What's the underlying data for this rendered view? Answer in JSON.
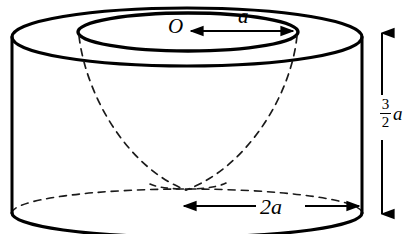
{
  "figure": {
    "stroke_color": "#000000",
    "background_color": "#ffffff",
    "dashed_color": "#1a1a1a",
    "labels": {
      "center": "O",
      "radius": "a",
      "diameter": "2a",
      "height_numerator": "3",
      "height_denominator": "2",
      "height_unit": "a"
    },
    "dimensions": {
      "top_outer_ellipse": {
        "cx": 187,
        "cy": 37,
        "rx": 175,
        "ry": 29
      },
      "top_inner_ellipse": {
        "cx": 188,
        "cy": 32,
        "rx": 110,
        "ry": 19
      },
      "bottom_ellipse": {
        "cx": 187,
        "cy": 213,
        "rx": 175,
        "ry": 24
      },
      "cylinder_left_x": 12,
      "cylinder_right_x": 362,
      "cylinder_top_y": 37,
      "cylinder_bottom_y": 213
    },
    "arrows": {
      "radius_arrow": {
        "from_x": 295,
        "to_x": 190,
        "y": 31,
        "heads": "left-and-right"
      },
      "diameter_arrow": {
        "from_x": 182,
        "to_x": 360,
        "y": 206,
        "heads": "both"
      },
      "height_arrow": {
        "x": 382,
        "from_y": 32,
        "to_y": 215,
        "heads": "both"
      }
    }
  }
}
